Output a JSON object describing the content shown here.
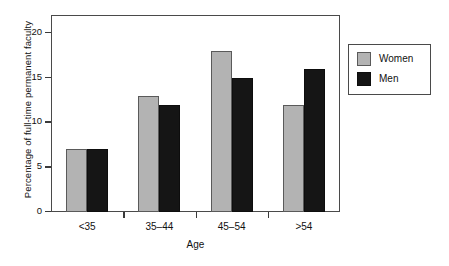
{
  "chart_data": {
    "type": "bar",
    "title": "",
    "xlabel": "Age",
    "ylabel": "Percentage of full-time permanent faculty",
    "categories": [
      "<35",
      "35–44",
      "45–54",
      ">54"
    ],
    "series": [
      {
        "name": "Women",
        "color": "#b3b3b3",
        "values": [
          7,
          13,
          18,
          12
        ]
      },
      {
        "name": "Men",
        "color": "#151515",
        "values": [
          7,
          12,
          15,
          16
        ]
      }
    ],
    "ylim": [
      0,
      22
    ],
    "yticks": [
      0,
      5,
      10,
      15,
      20
    ],
    "ytick_labels": [
      "0",
      "5",
      "10",
      "15",
      "20"
    ],
    "grid": false,
    "legend_position": "right-outside",
    "legend_entries": [
      "Women",
      "Men"
    ]
  },
  "axes": {
    "y_title": "Percentage of full-time permanent faculty",
    "x_title": "Age"
  },
  "legend": {
    "items": [
      {
        "label": "Women"
      },
      {
        "label": "Men"
      }
    ]
  }
}
